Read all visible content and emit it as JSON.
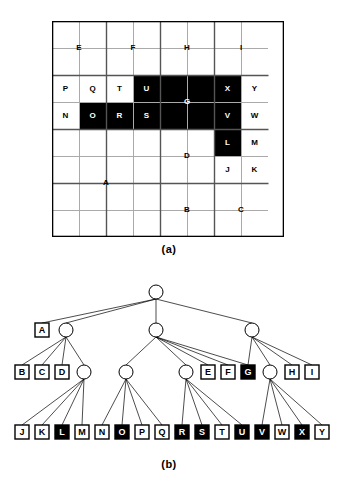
{
  "figure": {
    "panel_a_caption": "(a)",
    "panel_b_caption": "(b)",
    "colors": {
      "filled": "#000000",
      "empty": "#ffffff",
      "grid_line": "#aaaaaa",
      "block_line": "#555555",
      "border": "#000000",
      "label_on_dark": "#ffffff",
      "label_on_light": "#000000"
    }
  },
  "grid": {
    "cols": 8,
    "rows": 8,
    "cell_px": 27,
    "regions": [
      {
        "id": "A",
        "label": "A",
        "x": 0,
        "y": 4,
        "w": 4,
        "h": 4,
        "filled": false,
        "label_cx": 2,
        "label_cy": 6
      },
      {
        "id": "B",
        "label": "B",
        "x": 4,
        "y": 6,
        "w": 2,
        "h": 2,
        "filled": false,
        "label_cx": 5,
        "label_cy": 7
      },
      {
        "id": "C",
        "label": "C",
        "x": 6,
        "y": 6,
        "w": 2,
        "h": 2,
        "filled": false,
        "label_cx": 7,
        "label_cy": 7
      },
      {
        "id": "D",
        "label": "D",
        "x": 4,
        "y": 4,
        "w": 2,
        "h": 2,
        "filled": false,
        "label_cx": 5,
        "label_cy": 5
      },
      {
        "id": "E",
        "label": "E",
        "x": 0,
        "y": 0,
        "w": 2,
        "h": 2,
        "filled": false,
        "label_cx": 1,
        "label_cy": 1
      },
      {
        "id": "F",
        "label": "F",
        "x": 2,
        "y": 0,
        "w": 2,
        "h": 2,
        "filled": false,
        "label_cx": 3,
        "label_cy": 1
      },
      {
        "id": "G",
        "label": "G",
        "x": 4,
        "y": 2,
        "w": 2,
        "h": 2,
        "filled": true,
        "label_cx": 5,
        "label_cy": 3
      },
      {
        "id": "H",
        "label": "H",
        "x": 4,
        "y": 0,
        "w": 2,
        "h": 2,
        "filled": false,
        "label_cx": 5,
        "label_cy": 1
      },
      {
        "id": "I",
        "label": "I",
        "x": 6,
        "y": 0,
        "w": 2,
        "h": 2,
        "filled": false,
        "label_cx": 7,
        "label_cy": 1
      },
      {
        "id": "J",
        "label": "J",
        "x": 6,
        "y": 5,
        "w": 1,
        "h": 1,
        "filled": false,
        "label_cx": 6.5,
        "label_cy": 5.5
      },
      {
        "id": "K",
        "label": "K",
        "x": 7,
        "y": 5,
        "w": 1,
        "h": 1,
        "filled": false,
        "label_cx": 7.5,
        "label_cy": 5.5
      },
      {
        "id": "L",
        "label": "L",
        "x": 6,
        "y": 4,
        "w": 1,
        "h": 1,
        "filled": true,
        "label_cx": 6.5,
        "label_cy": 4.5
      },
      {
        "id": "M",
        "label": "M",
        "x": 7,
        "y": 4,
        "w": 1,
        "h": 1,
        "filled": false,
        "label_cx": 7.5,
        "label_cy": 4.5
      },
      {
        "id": "N",
        "label": "N",
        "x": 0,
        "y": 3,
        "w": 1,
        "h": 1,
        "filled": false,
        "label_cx": 0.5,
        "label_cy": 3.5
      },
      {
        "id": "O",
        "label": "O",
        "x": 1,
        "y": 3,
        "w": 1,
        "h": 1,
        "filled": true,
        "label_cx": 1.5,
        "label_cy": 3.5
      },
      {
        "id": "P",
        "label": "P",
        "x": 0,
        "y": 2,
        "w": 1,
        "h": 1,
        "filled": false,
        "label_cx": 0.5,
        "label_cy": 2.5
      },
      {
        "id": "Q",
        "label": "Q",
        "x": 1,
        "y": 2,
        "w": 1,
        "h": 1,
        "filled": false,
        "label_cx": 1.5,
        "label_cy": 2.5
      },
      {
        "id": "R",
        "label": "R",
        "x": 2,
        "y": 3,
        "w": 1,
        "h": 1,
        "filled": true,
        "label_cx": 2.5,
        "label_cy": 3.5
      },
      {
        "id": "S",
        "label": "S",
        "x": 3,
        "y": 3,
        "w": 1,
        "h": 1,
        "filled": true,
        "label_cx": 3.5,
        "label_cy": 3.5
      },
      {
        "id": "T",
        "label": "T",
        "x": 2,
        "y": 2,
        "w": 1,
        "h": 1,
        "filled": false,
        "label_cx": 2.5,
        "label_cy": 2.5
      },
      {
        "id": "U",
        "label": "U",
        "x": 3,
        "y": 2,
        "w": 1,
        "h": 1,
        "filled": true,
        "label_cx": 3.5,
        "label_cy": 2.5
      },
      {
        "id": "V",
        "label": "V",
        "x": 6,
        "y": 3,
        "w": 1,
        "h": 1,
        "filled": true,
        "label_cx": 6.5,
        "label_cy": 3.5
      },
      {
        "id": "W",
        "label": "W",
        "x": 7,
        "y": 3,
        "w": 1,
        "h": 1,
        "filled": false,
        "label_cx": 7.5,
        "label_cy": 3.5
      },
      {
        "id": "X",
        "label": "X",
        "x": 6,
        "y": 2,
        "w": 1,
        "h": 1,
        "filled": true,
        "label_cx": 6.5,
        "label_cy": 2.5
      },
      {
        "id": "Y",
        "label": "Y",
        "x": 7,
        "y": 2,
        "w": 1,
        "h": 1,
        "filled": false,
        "label_cx": 7.5,
        "label_cy": 2.5
      }
    ],
    "block_lines": [
      {
        "x1": 0,
        "y1": 2,
        "x2": 8,
        "y2": 2
      },
      {
        "x1": 0,
        "y1": 4,
        "x2": 8,
        "y2": 4
      },
      {
        "x1": 0,
        "y1": 6,
        "x2": 8,
        "y2": 6
      },
      {
        "x1": 2,
        "y1": 0,
        "x2": 2,
        "y2": 8
      },
      {
        "x1": 4,
        "y1": 0,
        "x2": 4,
        "y2": 8
      },
      {
        "x1": 6,
        "y1": 0,
        "x2": 6,
        "y2": 8
      }
    ]
  },
  "tree": {
    "levels": 4,
    "nodes": [
      {
        "id": "root",
        "kind": "circle",
        "label": "",
        "filled": false,
        "x": 156,
        "y": 22
      },
      {
        "id": "n1",
        "kind": "circle",
        "label": "",
        "filled": false,
        "x": 66,
        "y": 60
      },
      {
        "id": "A",
        "kind": "box",
        "label": "A",
        "filled": false,
        "x": 42,
        "y": 60
      },
      {
        "id": "n2",
        "kind": "circle",
        "label": "",
        "filled": false,
        "x": 156,
        "y": 60
      },
      {
        "id": "n3",
        "kind": "circle",
        "label": "",
        "filled": false,
        "x": 252,
        "y": 60
      },
      {
        "id": "B",
        "kind": "box",
        "label": "B",
        "filled": false,
        "x": 22,
        "y": 102
      },
      {
        "id": "C",
        "kind": "box",
        "label": "C",
        "filled": false,
        "x": 42,
        "y": 102
      },
      {
        "id": "D",
        "kind": "box",
        "label": "D",
        "filled": false,
        "x": 62,
        "y": 102
      },
      {
        "id": "n4",
        "kind": "circle",
        "label": "",
        "filled": false,
        "x": 84,
        "y": 102
      },
      {
        "id": "n5",
        "kind": "circle",
        "label": "",
        "filled": false,
        "x": 126,
        "y": 102
      },
      {
        "id": "n6",
        "kind": "circle",
        "label": "",
        "filled": false,
        "x": 186,
        "y": 102
      },
      {
        "id": "E",
        "kind": "box",
        "label": "E",
        "filled": false,
        "x": 208,
        "y": 102
      },
      {
        "id": "F",
        "kind": "box",
        "label": "F",
        "filled": false,
        "x": 228,
        "y": 102
      },
      {
        "id": "G",
        "kind": "box",
        "label": "G",
        "filled": true,
        "x": 248,
        "y": 102
      },
      {
        "id": "n7",
        "kind": "circle",
        "label": "",
        "filled": false,
        "x": 270,
        "y": 102
      },
      {
        "id": "H",
        "kind": "box",
        "label": "H",
        "filled": false,
        "x": 292,
        "y": 102
      },
      {
        "id": "I",
        "kind": "box",
        "label": "I",
        "filled": false,
        "x": 312,
        "y": 102
      },
      {
        "id": "J",
        "kind": "box",
        "label": "J",
        "filled": false,
        "x": 22,
        "y": 162
      },
      {
        "id": "K",
        "kind": "box",
        "label": "K",
        "filled": false,
        "x": 42,
        "y": 162
      },
      {
        "id": "L",
        "kind": "box",
        "label": "L",
        "filled": true,
        "x": 62,
        "y": 162
      },
      {
        "id": "M",
        "kind": "box",
        "label": "M",
        "filled": false,
        "x": 82,
        "y": 162
      },
      {
        "id": "N",
        "kind": "box",
        "label": "N",
        "filled": false,
        "x": 102,
        "y": 162
      },
      {
        "id": "O",
        "kind": "box",
        "label": "O",
        "filled": true,
        "x": 122,
        "y": 162
      },
      {
        "id": "P",
        "kind": "box",
        "label": "P",
        "filled": false,
        "x": 142,
        "y": 162
      },
      {
        "id": "Q",
        "kind": "box",
        "label": "Q",
        "filled": false,
        "x": 162,
        "y": 162
      },
      {
        "id": "R",
        "kind": "box",
        "label": "R",
        "filled": true,
        "x": 182,
        "y": 162
      },
      {
        "id": "S",
        "kind": "box",
        "label": "S",
        "filled": true,
        "x": 202,
        "y": 162
      },
      {
        "id": "T",
        "kind": "box",
        "label": "T",
        "filled": false,
        "x": 222,
        "y": 162
      },
      {
        "id": "U",
        "kind": "box",
        "label": "U",
        "filled": true,
        "x": 242,
        "y": 162
      },
      {
        "id": "V",
        "kind": "box",
        "label": "V",
        "filled": true,
        "x": 262,
        "y": 162
      },
      {
        "id": "W",
        "kind": "box",
        "label": "W",
        "filled": false,
        "x": 282,
        "y": 162
      },
      {
        "id": "X",
        "kind": "box",
        "label": "X",
        "filled": true,
        "x": 302,
        "y": 162
      },
      {
        "id": "Y",
        "kind": "box",
        "label": "Y",
        "filled": false,
        "x": 322,
        "y": 162
      }
    ],
    "edges": [
      [
        "root",
        "A"
      ],
      [
        "root",
        "n1"
      ],
      [
        "root",
        "n2"
      ],
      [
        "root",
        "n3"
      ],
      [
        "n1",
        "B"
      ],
      [
        "n1",
        "C"
      ],
      [
        "n1",
        "D"
      ],
      [
        "n1",
        "n4"
      ],
      [
        "n2",
        "n5"
      ],
      [
        "n2",
        "n6"
      ],
      [
        "n2",
        "E"
      ],
      [
        "n2",
        "F"
      ],
      [
        "n2",
        "G"
      ],
      [
        "n3",
        "G"
      ],
      [
        "n3",
        "n7"
      ],
      [
        "n3",
        "H"
      ],
      [
        "n3",
        "I"
      ],
      [
        "n4",
        "J"
      ],
      [
        "n4",
        "K"
      ],
      [
        "n4",
        "L"
      ],
      [
        "n4",
        "M"
      ],
      [
        "n5",
        "N"
      ],
      [
        "n5",
        "O"
      ],
      [
        "n5",
        "P"
      ],
      [
        "n5",
        "Q"
      ],
      [
        "n6",
        "R"
      ],
      [
        "n6",
        "S"
      ],
      [
        "n6",
        "T"
      ],
      [
        "n6",
        "U"
      ],
      [
        "n7",
        "V"
      ],
      [
        "n7",
        "W"
      ],
      [
        "n7",
        "X"
      ],
      [
        "n7",
        "Y"
      ]
    ]
  }
}
